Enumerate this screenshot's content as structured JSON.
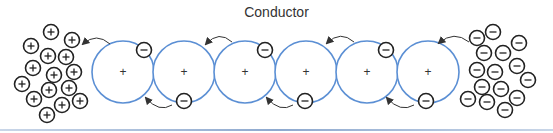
{
  "title": "Conductor",
  "colors": {
    "atom_stroke": "#5b8fd4",
    "particle_stroke": "#222222",
    "arrow": "#333333"
  },
  "atoms": [
    {
      "cx": 123,
      "cy": 72,
      "label": "+"
    },
    {
      "cx": 184,
      "cy": 72,
      "label": "+"
    },
    {
      "cx": 245,
      "cy": 72,
      "label": "+"
    },
    {
      "cx": 306,
      "cy": 72,
      "label": "+"
    },
    {
      "cx": 367,
      "cy": 72,
      "label": "+"
    },
    {
      "cx": 428,
      "cy": 72,
      "label": "+"
    }
  ],
  "electrons_on_atoms": [
    {
      "x": 144,
      "y": 50
    },
    {
      "x": 265,
      "y": 50
    },
    {
      "x": 386,
      "y": 50
    },
    {
      "x": 184,
      "y": 101
    },
    {
      "x": 305,
      "y": 101
    },
    {
      "x": 426,
      "y": 101
    }
  ],
  "positive_cluster": [
    {
      "x": 51,
      "y": 32
    },
    {
      "x": 72,
      "y": 40
    },
    {
      "x": 31,
      "y": 46
    },
    {
      "x": 48,
      "y": 56
    },
    {
      "x": 66,
      "y": 57
    },
    {
      "x": 33,
      "y": 68
    },
    {
      "x": 54,
      "y": 75
    },
    {
      "x": 74,
      "y": 72
    },
    {
      "x": 22,
      "y": 84
    },
    {
      "x": 49,
      "y": 90
    },
    {
      "x": 69,
      "y": 88
    },
    {
      "x": 34,
      "y": 99
    },
    {
      "x": 80,
      "y": 101
    },
    {
      "x": 62,
      "y": 105
    },
    {
      "x": 47,
      "y": 115
    }
  ],
  "negative_cluster": [
    {
      "x": 493,
      "y": 32
    },
    {
      "x": 477,
      "y": 38
    },
    {
      "x": 519,
      "y": 43
    },
    {
      "x": 484,
      "y": 53
    },
    {
      "x": 503,
      "y": 53
    },
    {
      "x": 477,
      "y": 70
    },
    {
      "x": 495,
      "y": 72
    },
    {
      "x": 517,
      "y": 66
    },
    {
      "x": 482,
      "y": 87
    },
    {
      "x": 501,
      "y": 89
    },
    {
      "x": 528,
      "y": 80
    },
    {
      "x": 468,
      "y": 99
    },
    {
      "x": 487,
      "y": 102
    },
    {
      "x": 517,
      "y": 98
    },
    {
      "x": 505,
      "y": 110
    }
  ],
  "top_arrows": [
    {
      "from": [
        110,
        44
      ],
      "to": [
        83,
        44
      ]
    },
    {
      "from": [
        232,
        42
      ],
      "to": [
        206,
        44
      ]
    },
    {
      "from": [
        354,
        42
      ],
      "to": [
        327,
        43
      ]
    },
    {
      "from": [
        469,
        42
      ],
      "to": [
        439,
        43
      ]
    }
  ],
  "bottom_arrows": [
    {
      "from": [
        172,
        105
      ],
      "to": [
        146,
        98
      ]
    },
    {
      "from": [
        293,
        105
      ],
      "to": [
        267,
        98
      ]
    },
    {
      "from": [
        414,
        105
      ],
      "to": [
        387,
        98
      ]
    }
  ]
}
